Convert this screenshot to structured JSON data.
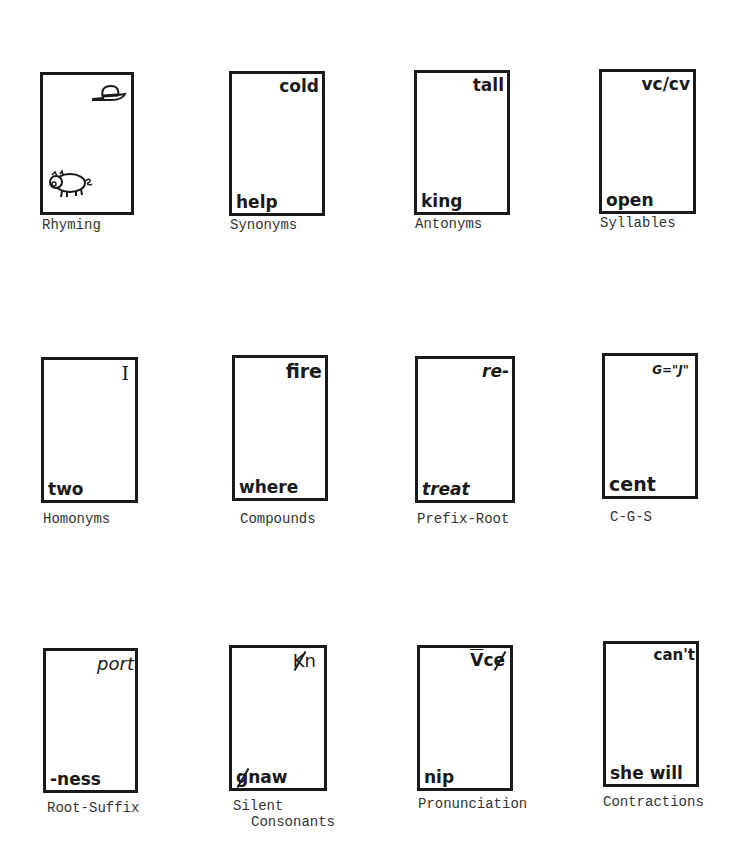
{
  "cards": [
    {
      "id": "rhyming",
      "label": "Rhyming",
      "top_word": "",
      "bottom_word": "",
      "top_icon": "hat-icon",
      "bottom_icon": "pig-icon"
    },
    {
      "id": "synonyms",
      "label": "Synonyms",
      "top_word": "cold",
      "bottom_word": "help"
    },
    {
      "id": "antonyms",
      "label": "Antonyms",
      "top_word": "tall",
      "bottom_word": "king"
    },
    {
      "id": "syllables",
      "label": "Syllables",
      "top_word": "vc/cv",
      "bottom_word": "open"
    },
    {
      "id": "homonyms",
      "label": "Homonyms",
      "top_word": "I",
      "bottom_word": "two"
    },
    {
      "id": "compounds",
      "label": "Compounds",
      "top_word": "fire",
      "bottom_word": "where"
    },
    {
      "id": "prefix-root",
      "label": "Prefix-Root",
      "top_word": "re-",
      "bottom_word": "treat"
    },
    {
      "id": "c-g-s",
      "label": "C-G-S",
      "top_word": "G=\"J\"",
      "bottom_word": "cent"
    },
    {
      "id": "root-suffix",
      "label": "Root-Suffix",
      "top_word": "port",
      "bottom_word": "-ness"
    },
    {
      "id": "silent-consonants",
      "label": "Silent",
      "label_line2": "Consonants",
      "top_word_struck": "K",
      "top_word_rest": "n",
      "bottom_word_struck": "g",
      "bottom_word_rest": "naw"
    },
    {
      "id": "pronunciation",
      "label": "Pronunciation",
      "top_word_macron": "V",
      "top_word_mid": "c",
      "top_word_struck": "e",
      "bottom_word": "nip"
    },
    {
      "id": "contractions",
      "label": "Contractions",
      "top_word": "can't",
      "bottom_word": "she will"
    }
  ]
}
